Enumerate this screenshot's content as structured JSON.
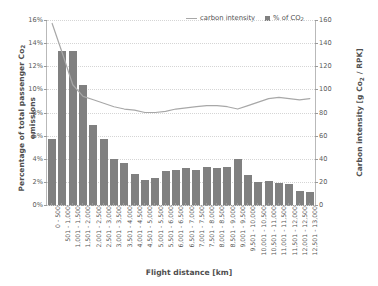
{
  "chart_data": {
    "type": "bar",
    "title": "",
    "xlabel": "Flight distance [km]",
    "ylabel": "Percentage of total passenger Co2 emissions",
    "ylabel_right": "Carbon intensity [g Co2 / RPK]",
    "ylim": [
      0,
      16
    ],
    "ylim_right": [
      0,
      160
    ],
    "grid": true,
    "legend_position": "top-right",
    "yticks": [
      "0%",
      "2%",
      "4%",
      "6%",
      "8%",
      "10%",
      "12%",
      "14%",
      "16%"
    ],
    "yticks_right": [
      "0",
      "20",
      "40",
      "60",
      "80",
      "100",
      "120",
      "140",
      "160"
    ],
    "categories": [
      "0 - 500",
      "501 - 1,000",
      "1,001 - 1,500",
      "1,501 - 2,000",
      "2,001 - 2,500",
      "2,501 - 3,000",
      "3,001 - 3,500",
      "3,501 - 4,000",
      "4,001 - 4,500",
      "4,501 - 5,000",
      "5,001 - 5,500",
      "5,501 - 6,000",
      "6,001 - 6,500",
      "6,501 - 7,000",
      "7,001 - 7,500",
      "7,501 - 8,000",
      "8,001 - 8,500",
      "8,501 - 9,000",
      "9,001 - 9,500",
      "9,501 - 10,000",
      "10,001 - 10,500",
      "10,501 - 11,000",
      "11,001 - 11,500",
      "11,501 - 12,000",
      "12,001 - 12,500",
      "12,501 - 13,000"
    ],
    "series": [
      {
        "name": "% of CO2",
        "type": "bar",
        "axis": "left",
        "unit": "%",
        "color": "#808080",
        "values": [
          5.7,
          13.3,
          13.3,
          10.4,
          6.9,
          5.7,
          4.0,
          3.6,
          2.7,
          2.2,
          2.3,
          2.9,
          3.0,
          3.2,
          3.0,
          3.3,
          3.2,
          3.3,
          4.0,
          2.6,
          2.0,
          2.1,
          1.9,
          1.8,
          1.2,
          1.1
        ]
      },
      {
        "name": "carbon intensity",
        "type": "line",
        "axis": "right",
        "unit": "g Co2 / RPK",
        "color": "#a8a8a8",
        "values": [
          157,
          131,
          104,
          94,
          91,
          88,
          85,
          83,
          82,
          80,
          80,
          81,
          83,
          84,
          85,
          86,
          86,
          85,
          83,
          86,
          89,
          92,
          93,
          92,
          91,
          92
        ]
      }
    ]
  },
  "legend": {
    "items": [
      {
        "label": "carbon intensity",
        "marker": "line",
        "color": "#a8a8a8"
      },
      {
        "label": "% of CO",
        "sub": "2",
        "marker": "square",
        "color": "#808080"
      }
    ]
  },
  "axis_titles": {
    "left_pre": "Percentage of total passenger Co",
    "left_sub": "2",
    "left_post": " emissions",
    "right_pre": "Carbon intensity [g Co",
    "right_sub": "2",
    "right_post": " / RPK]",
    "x": "Flight distance [km]"
  }
}
